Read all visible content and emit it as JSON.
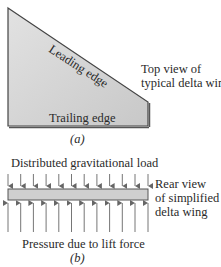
{
  "figure_a": {
    "leading_edge_label": "Leading edge",
    "trailing_edge_label": "Trailing edge",
    "description_line1": "Top view of",
    "description_line2": "typical delta wing",
    "caption": "(a)",
    "colors": {
      "fill": "#d2d2d2",
      "outline": "#444444"
    }
  },
  "figure_b": {
    "top_label": "Distributed gravitational load",
    "bottom_label": "Pressure due to lift force",
    "description_line1": "Rear view",
    "description_line2": "of simplified",
    "description_line3": "delta wing",
    "caption": "(b)",
    "arrow_count_top": 12,
    "arrow_count_bottom": 12,
    "colors": {
      "fill": "#cfcfcf",
      "outline": "#555555",
      "arrow": "#666666"
    }
  }
}
